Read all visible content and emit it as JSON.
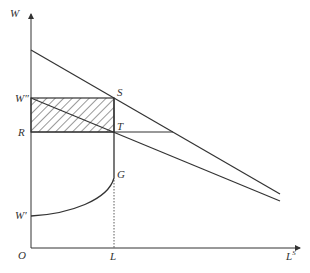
{
  "diagram": {
    "axes": {
      "y_label": "W",
      "x_label": "L",
      "x_label_sup": "S",
      "origin": "O"
    },
    "labels": {
      "w_double_prime": "W″",
      "r": "R",
      "w_prime": "W′",
      "s": "S",
      "t": "T",
      "g": "G",
      "l": "L"
    },
    "colors": {
      "line": "#333333",
      "background": "#ffffff"
    }
  }
}
